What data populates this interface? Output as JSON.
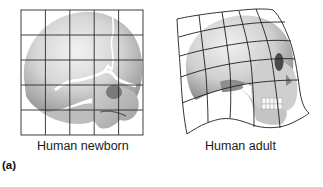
{
  "figure": {
    "panel_label": "(a)",
    "panels": [
      {
        "id": "newborn",
        "caption": "Human newborn",
        "grid": {
          "type": "regular",
          "rows": 5,
          "cols": 5
        }
      },
      {
        "id": "adult",
        "caption": "Human adult",
        "grid": {
          "type": "transformed",
          "rows": 5,
          "cols": 5
        }
      }
    ]
  },
  "colors": {
    "grid_line": "#2a2a2a",
    "skull_light": "#e8e8e8",
    "skull_mid": "#b8b8b8",
    "skull_dark": "#6a6a6a",
    "text": "#1a1a1a"
  }
}
